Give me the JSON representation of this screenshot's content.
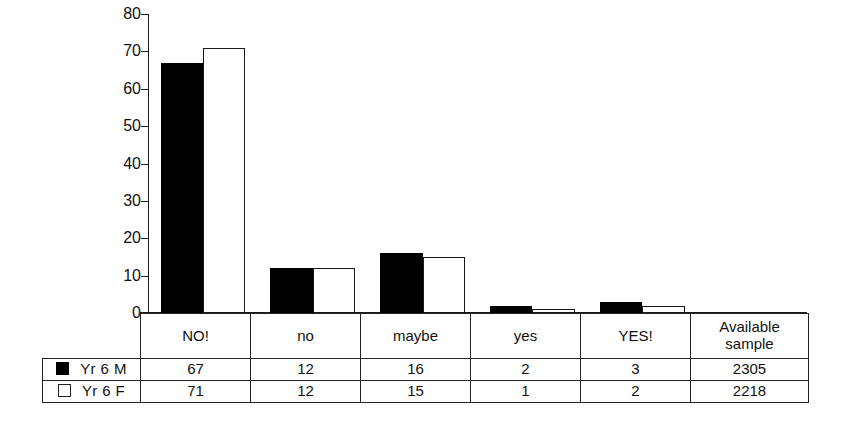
{
  "chart_data": {
    "type": "bar",
    "title": "",
    "subtitle": "",
    "xlabel": "",
    "ylabel": "",
    "ylim": [
      0,
      80
    ],
    "yticks": [
      0,
      10,
      20,
      30,
      40,
      50,
      60,
      70,
      80
    ],
    "ytick_labels": [
      "0",
      "10",
      "20",
      "30",
      "40",
      "50",
      "60",
      "70",
      "80"
    ],
    "grid": false,
    "legend_position": "table-left",
    "categories": [
      "NO!",
      "no",
      "maybe",
      "yes",
      "YES!"
    ],
    "series": [
      {
        "name": "Yr 6 M",
        "values": [
          67,
          12,
          16,
          2,
          3
        ],
        "color": "#000000",
        "swatch": "filled"
      },
      {
        "name": "Yr 6 F",
        "values": [
          71,
          12,
          15,
          1,
          2
        ],
        "color": "#ffffff",
        "swatch": "open"
      }
    ],
    "extra_column": {
      "header_line1": "Available",
      "header_line2": "sample",
      "values": [
        "2305",
        "2218"
      ]
    }
  },
  "table": {
    "header_cells": [
      "NO!",
      "no",
      "maybe",
      "yes",
      "YES!"
    ],
    "available_header_line1": "Available",
    "available_header_line2": "sample",
    "rows": [
      {
        "label": "Yr 6 M",
        "swatch": "filled",
        "cells": [
          "67",
          "12",
          "16",
          "2",
          "3"
        ],
        "sample": "2305"
      },
      {
        "label": "Yr 6 F",
        "swatch": "open",
        "cells": [
          "71",
          "12",
          "15",
          "1",
          "2"
        ],
        "sample": "2218"
      }
    ]
  },
  "colors": {
    "male_bar": "#000000",
    "female_bar": "#ffffff",
    "line": "#1a1a1a",
    "text": "#111111",
    "background": "#ffffff"
  }
}
